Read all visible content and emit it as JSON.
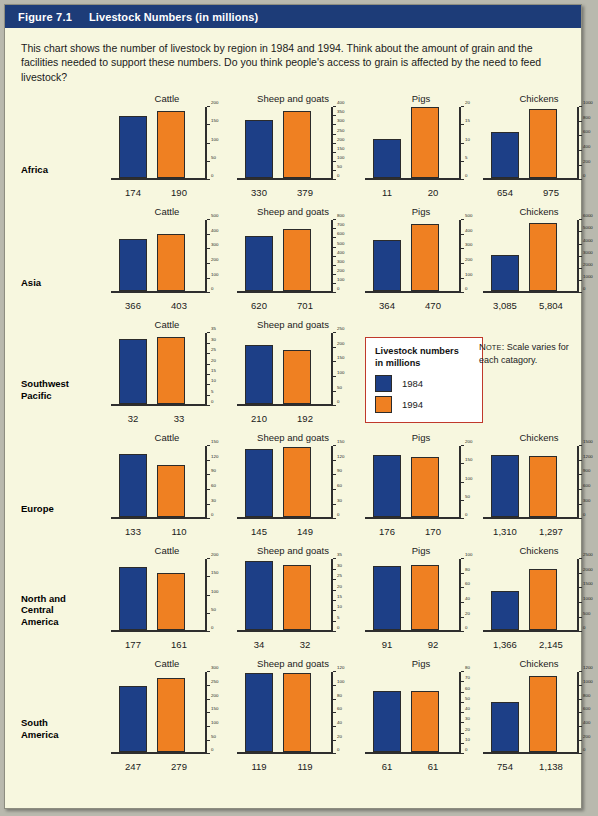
{
  "header": {
    "figure_number": "Figure 7.1",
    "title": "Livestock Numbers (in millions)"
  },
  "intro": "This chart shows the number of livestock by region in 1984 and 1994. Think about the amount of grain and the facilities needed to support these numbers. Do you think people's access to grain is affected by the need to feed livestock?",
  "legend": {
    "title_line1": "Livestock numbers",
    "title_line2": "in millions",
    "items": [
      {
        "label": "1984",
        "color": "#1d3f87"
      },
      {
        "label": "1994",
        "color": "#ef8022"
      }
    ]
  },
  "note": {
    "prefix": "Note",
    "text": ": Scale varies for each catagory."
  },
  "colors": {
    "header_bar": "#1d3c78",
    "page_bg": "#f7f7df",
    "bar_1984": "#1d3f87",
    "bar_1994": "#ef8022",
    "legend_border": "#c0392b"
  },
  "chart_data": {
    "type": "bar",
    "title": "Livestock Numbers (in millions)",
    "series": [
      {
        "name": "1984",
        "color": "#1d3f87"
      },
      {
        "name": "1994",
        "color": "#ef8022"
      }
    ],
    "categories": [
      "Cattle",
      "Sheep and goats",
      "Pigs",
      "Chickens"
    ],
    "regions": [
      "Africa",
      "Asia",
      "Southwest Pacific",
      "Europe",
      "North and Central America",
      "South America"
    ],
    "grid": false,
    "legend_position": "middle-center",
    "note": "Scale varies for each catagory.",
    "rows": [
      {
        "region": "Africa",
        "region_lines": [
          "Africa"
        ],
        "panels": [
          {
            "category": "Cattle",
            "values": [
              174,
              190
            ],
            "labels": [
              "174",
              "190"
            ],
            "ylim": [
              0,
              200
            ],
            "ticks": [
              0,
              50,
              100,
              150,
              200
            ]
          },
          {
            "category": "Sheep and goats",
            "values": [
              330,
              379
            ],
            "labels": [
              "330",
              "379"
            ],
            "ylim": [
              0,
              400
            ],
            "ticks": [
              0,
              50,
              100,
              150,
              200,
              250,
              300,
              350,
              400
            ]
          },
          {
            "category": "Pigs",
            "values": [
              11,
              20
            ],
            "labels": [
              "11",
              "20"
            ],
            "ylim": [
              0,
              20
            ],
            "ticks": [
              0,
              5,
              10,
              15,
              20
            ]
          },
          {
            "category": "Chickens",
            "values": [
              654,
              975
            ],
            "labels": [
              "654",
              "975"
            ],
            "ylim": [
              0,
              1000
            ],
            "ticks": [
              0,
              200,
              400,
              600,
              800,
              1000
            ]
          }
        ]
      },
      {
        "region": "Asia",
        "region_lines": [
          "Asia"
        ],
        "panels": [
          {
            "category": "Cattle",
            "values": [
              366,
              403
            ],
            "labels": [
              "366",
              "403"
            ],
            "ylim": [
              0,
              500
            ],
            "ticks": [
              0,
              100,
              200,
              300,
              400,
              500
            ]
          },
          {
            "category": "Sheep and goats",
            "values": [
              620,
              701
            ],
            "labels": [
              "620",
              "701"
            ],
            "ylim": [
              0,
              800
            ],
            "ticks": [
              0,
              100,
              200,
              300,
              400,
              500,
              600,
              700,
              800
            ]
          },
          {
            "category": "Pigs",
            "values": [
              364,
              470
            ],
            "labels": [
              "364",
              "470"
            ],
            "ylim": [
              0,
              500
            ],
            "ticks": [
              0,
              100,
              200,
              300,
              400,
              500
            ]
          },
          {
            "category": "Chickens",
            "values": [
              3085,
              5804
            ],
            "labels": [
              "3,085",
              "5,804"
            ],
            "ylim": [
              0,
              6000
            ],
            "ticks": [
              0,
              1000,
              2000,
              3000,
              4000,
              5000,
              6000
            ]
          }
        ]
      },
      {
        "region": "Southwest Pacific",
        "region_lines": [
          "Southwest",
          "Pacific"
        ],
        "panels": [
          {
            "category": "Cattle",
            "values": [
              32,
              33
            ],
            "labels": [
              "32",
              "33"
            ],
            "ylim": [
              0,
              35
            ],
            "ticks": [
              0,
              5,
              10,
              15,
              20,
              25,
              30,
              35
            ]
          },
          {
            "category": "Sheep and goats",
            "values": [
              210,
              192
            ],
            "labels": [
              "210",
              "192"
            ],
            "ylim": [
              0,
              250
            ],
            "ticks": [
              0,
              50,
              100,
              150,
              200,
              250
            ]
          },
          {
            "category": "legend",
            "values": [],
            "labels": [],
            "ylim": [
              0,
              0
            ],
            "ticks": []
          },
          {
            "category": "note",
            "values": [],
            "labels": [],
            "ylim": [
              0,
              0
            ],
            "ticks": []
          }
        ]
      },
      {
        "region": "Europe",
        "region_lines": [
          "Europe"
        ],
        "panels": [
          {
            "category": "Cattle",
            "values": [
              133,
              110
            ],
            "labels": [
              "133",
              "110"
            ],
            "ylim": [
              0,
              150
            ],
            "ticks": [
              0,
              30,
              60,
              90,
              120,
              150
            ]
          },
          {
            "category": "Sheep and goats",
            "values": [
              145,
              149
            ],
            "labels": [
              "145",
              "149"
            ],
            "ylim": [
              0,
              150
            ],
            "ticks": [
              0,
              30,
              60,
              90,
              120,
              150
            ]
          },
          {
            "category": "Pigs",
            "values": [
              176,
              170
            ],
            "labels": [
              "176",
              "170"
            ],
            "ylim": [
              0,
              200
            ],
            "ticks": [
              0,
              50,
              100,
              150,
              200
            ]
          },
          {
            "category": "Chickens",
            "values": [
              1310,
              1297
            ],
            "labels": [
              "1,310",
              "1,297"
            ],
            "ylim": [
              0,
              1500
            ],
            "ticks": [
              0,
              300,
              600,
              900,
              1200,
              1500
            ]
          }
        ]
      },
      {
        "region": "North and Central America",
        "region_lines": [
          "North and",
          "Central",
          "America"
        ],
        "panels": [
          {
            "category": "Cattle",
            "values": [
              177,
              161
            ],
            "labels": [
              "177",
              "161"
            ],
            "ylim": [
              0,
              200
            ],
            "ticks": [
              0,
              50,
              100,
              150,
              200
            ]
          },
          {
            "category": "Sheep and goats",
            "values": [
              34,
              32
            ],
            "labels": [
              "34",
              "32"
            ],
            "ylim": [
              0,
              35
            ],
            "ticks": [
              0,
              5,
              10,
              15,
              20,
              25,
              30,
              35
            ]
          },
          {
            "category": "Pigs",
            "values": [
              91,
              92
            ],
            "labels": [
              "91",
              "92"
            ],
            "ylim": [
              0,
              100
            ],
            "ticks": [
              0,
              20,
              40,
              60,
              80,
              100
            ]
          },
          {
            "category": "Chickens",
            "values": [
              1366,
              2145
            ],
            "labels": [
              "1,366",
              "2,145"
            ],
            "ylim": [
              0,
              2500
            ],
            "ticks": [
              0,
              500,
              1000,
              1500,
              2000,
              2500
            ]
          }
        ]
      },
      {
        "region": "South America",
        "region_lines": [
          "South",
          "America"
        ],
        "panels": [
          {
            "category": "Cattle",
            "values": [
              247,
              279
            ],
            "labels": [
              "247",
              "279"
            ],
            "ylim": [
              0,
              300
            ],
            "ticks": [
              0,
              50,
              100,
              150,
              200,
              250,
              300
            ]
          },
          {
            "category": "Sheep and goats",
            "values": [
              119,
              119
            ],
            "labels": [
              "119",
              "119"
            ],
            "ylim": [
              0,
              120
            ],
            "ticks": [
              0,
              20,
              40,
              60,
              80,
              100,
              120
            ]
          },
          {
            "category": "Pigs",
            "values": [
              61,
              61
            ],
            "labels": [
              "61",
              "61"
            ],
            "ylim": [
              0,
              80
            ],
            "ticks": [
              0,
              10,
              20,
              30,
              40,
              50,
              60,
              70,
              80
            ]
          },
          {
            "category": "Chickens",
            "values": [
              754,
              1138
            ],
            "labels": [
              "754",
              "1,138"
            ],
            "ylim": [
              0,
              1200
            ],
            "ticks": [
              0,
              200,
              400,
              600,
              800,
              1000,
              1200
            ]
          }
        ]
      }
    ]
  }
}
